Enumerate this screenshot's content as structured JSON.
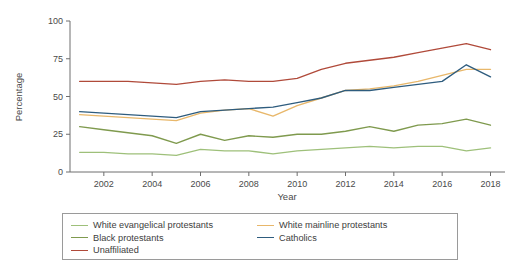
{
  "chart_data": {
    "type": "line",
    "title": "",
    "subtitle": "",
    "xlabel": "Year",
    "ylabel": "Percentage",
    "xlim": [
      2000.6,
      2018.6
    ],
    "ylim": [
      0,
      100
    ],
    "xticks": [
      2002,
      2004,
      2006,
      2008,
      2010,
      2012,
      2014,
      2016,
      2018
    ],
    "yticks": [
      0,
      25,
      50,
      75,
      100
    ],
    "grid": false,
    "legend_position": "below-plot",
    "x": [
      2001,
      2002,
      2003,
      2004,
      2005,
      2006,
      2007,
      2008,
      2009,
      2010,
      2011,
      2012,
      2013,
      2014,
      2015,
      2016,
      2017,
      2018
    ],
    "series": [
      {
        "name": "White evangelical protestants",
        "color": "#9ec07a",
        "values": [
          13,
          13,
          12,
          12,
          11,
          15,
          14,
          14,
          12,
          14,
          15,
          16,
          17,
          16,
          17,
          17,
          14,
          16
        ]
      },
      {
        "name": "White mainline protestants",
        "color": "#e8b76a",
        "values": [
          38,
          37,
          36,
          35,
          34,
          39,
          41,
          42,
          37,
          44,
          49,
          54,
          55,
          57,
          60,
          64,
          68,
          68
        ]
      },
      {
        "name": "Black protestants",
        "color": "#7f9a4e",
        "values": [
          30,
          28,
          26,
          24,
          19,
          25,
          21,
          24,
          23,
          25,
          25,
          27,
          30,
          27,
          31,
          32,
          35,
          31
        ]
      },
      {
        "name": "Catholics",
        "color": "#2e5c7e",
        "values": [
          40,
          39,
          38,
          37,
          36,
          40,
          41,
          42,
          43,
          46,
          49,
          54,
          54,
          56,
          58,
          60,
          71,
          63
        ]
      },
      {
        "name": "Unaffiliated",
        "color": "#b04a3a",
        "values": [
          60,
          60,
          60,
          59,
          58,
          60,
          61,
          60,
          60,
          62,
          68,
          72,
          74,
          76,
          79,
          82,
          85,
          81
        ]
      }
    ]
  },
  "axes": {
    "ylabel": "Percentage",
    "xlabel": "Year",
    "ytick_labels": [
      "0",
      "25",
      "50",
      "75",
      "100"
    ],
    "xtick_labels": [
      "2002",
      "2004",
      "2006",
      "2008",
      "2010",
      "2012",
      "2014",
      "2016",
      "2018"
    ]
  },
  "legend": {
    "items": [
      {
        "label": "White evangelical protestants",
        "color": "#9ec07a"
      },
      {
        "label": "White mainline protestants",
        "color": "#e8b76a"
      },
      {
        "label": "Black protestants",
        "color": "#7f9a4e"
      },
      {
        "label": "Catholics",
        "color": "#2e5c7e"
      },
      {
        "label": "Unaffiliated",
        "color": "#b04a3a"
      }
    ]
  }
}
